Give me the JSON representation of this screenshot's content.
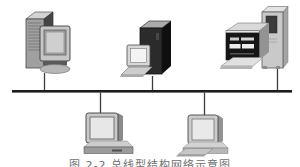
{
  "diagram": {
    "type": "bus-network-topology",
    "colors": {
      "background": "#ffffff",
      "bus": "#1d1d1d",
      "connector": "#3c3c3c"
    },
    "nodes": [
      {
        "id": "tower-workstation",
        "kind": "tower-pc-with-monitor",
        "position": "top-left"
      },
      {
        "id": "server-terminal",
        "kind": "black-tower-server-with-terminal",
        "position": "top-center"
      },
      {
        "id": "mainframe",
        "kind": "mainframe-with-console",
        "position": "top-right"
      },
      {
        "id": "desktop-a",
        "kind": "desktop-computer",
        "position": "bottom-left"
      },
      {
        "id": "desktop-b",
        "kind": "desktop-computer-with-keyboard",
        "position": "bottom-right"
      }
    ],
    "edges": [
      {
        "from": "tower-workstation",
        "to": "bus"
      },
      {
        "from": "server-terminal",
        "to": "bus"
      },
      {
        "from": "mainframe",
        "to": "bus"
      },
      {
        "from": "desktop-a",
        "to": "bus"
      },
      {
        "from": "desktop-b",
        "to": "bus"
      }
    ]
  },
  "caption": {
    "text": "图 2-2  总线型结构网络示意图"
  }
}
